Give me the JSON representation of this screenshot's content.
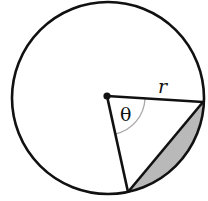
{
  "figure": {
    "labels": {
      "radius": "r",
      "angle": "θ"
    },
    "colors": {
      "stroke": "#111111",
      "shaded_segment": "#b9b9b9",
      "angle_arc": "#a8a8a8",
      "background": "#ffffff"
    },
    "geometry": {
      "circle_center": [
        108,
        98
      ],
      "circle_radius": 96,
      "point_a": [
        203,
        102
      ],
      "point_b": [
        128,
        192
      ],
      "angle_arc_radius": 38
    }
  }
}
